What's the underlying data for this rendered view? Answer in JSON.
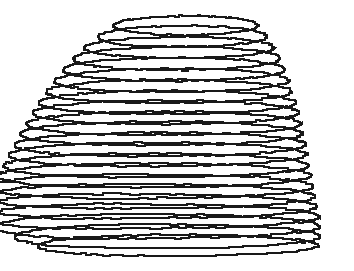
{
  "figure": {
    "title": "",
    "caption": "",
    "kind": "wireframe-contour-surface",
    "background_color": "#ffffff",
    "line_color": "#191919",
    "line_width_px": 2,
    "canvas": {
      "width": 354,
      "height": 271
    }
  },
  "chart_data": {
    "type": "line",
    "title": "",
    "subtitle": "",
    "xlabel": "",
    "ylabel": "",
    "xlim": [
      0,
      354
    ],
    "ylim": [
      0,
      271
    ],
    "grid": false,
    "legend": null,
    "annotations": [],
    "tick_labels": {
      "x": [],
      "y": []
    },
    "series_count": 22,
    "projection": {
      "type": "oblique",
      "shear_per_level_px": -6.2
    },
    "series": [
      {
        "name": "ring-01",
        "cx": 186,
        "cy": 26,
        "rx": 72,
        "ry": 9,
        "lobe": 0.0,
        "values": [
          72,
          9
        ]
      },
      {
        "name": "ring-02",
        "cx": 183,
        "cy": 37,
        "rx": 84,
        "ry": 10,
        "lobe": 0.02,
        "values": [
          84,
          10
        ]
      },
      {
        "name": "ring-03",
        "cx": 180,
        "cy": 48,
        "rx": 94,
        "ry": 10,
        "lobe": 0.04,
        "values": [
          94,
          10
        ]
      },
      {
        "name": "ring-04",
        "cx": 178,
        "cy": 59,
        "rx": 102,
        "ry": 11,
        "lobe": 0.06,
        "values": [
          102,
          11
        ]
      },
      {
        "name": "ring-05",
        "cx": 176,
        "cy": 70,
        "rx": 109,
        "ry": 11,
        "lobe": 0.08,
        "values": [
          109,
          11
        ]
      },
      {
        "name": "ring-06",
        "cx": 174,
        "cy": 81,
        "rx": 115,
        "ry": 11,
        "lobe": 0.11,
        "values": [
          115,
          11
        ]
      },
      {
        "name": "ring-07",
        "cx": 172,
        "cy": 92,
        "rx": 120,
        "ry": 11,
        "lobe": 0.14,
        "values": [
          120,
          11
        ]
      },
      {
        "name": "ring-08",
        "cx": 171,
        "cy": 103,
        "rx": 125,
        "ry": 11,
        "lobe": 0.17,
        "values": [
          125,
          11
        ]
      },
      {
        "name": "ring-09",
        "cx": 170,
        "cy": 113,
        "rx": 129,
        "ry": 11,
        "lobe": 0.21,
        "values": [
          129,
          11
        ]
      },
      {
        "name": "ring-10",
        "cx": 169,
        "cy": 124,
        "rx": 132,
        "ry": 11,
        "lobe": 0.25,
        "values": [
          132,
          11
        ]
      },
      {
        "name": "ring-11",
        "cx": 168,
        "cy": 134,
        "rx": 135,
        "ry": 11,
        "lobe": 0.3,
        "values": [
          135,
          11
        ]
      },
      {
        "name": "ring-12",
        "cx": 168,
        "cy": 145,
        "rx": 138,
        "ry": 11,
        "lobe": 0.36,
        "values": [
          138,
          11
        ]
      },
      {
        "name": "ring-13",
        "cx": 167,
        "cy": 155,
        "rx": 140,
        "ry": 11,
        "lobe": 0.43,
        "values": [
          140,
          11
        ]
      },
      {
        "name": "ring-14",
        "cx": 167,
        "cy": 166,
        "rx": 142,
        "ry": 11,
        "lobe": 0.51,
        "values": [
          142,
          11
        ]
      },
      {
        "name": "ring-15",
        "cx": 167,
        "cy": 176,
        "rx": 144,
        "ry": 11,
        "lobe": 0.6,
        "values": [
          144,
          11
        ]
      },
      {
        "name": "ring-16",
        "cx": 167,
        "cy": 187,
        "rx": 146,
        "ry": 11,
        "lobe": 0.7,
        "values": [
          146,
          11
        ]
      },
      {
        "name": "ring-17",
        "cx": 168,
        "cy": 197,
        "rx": 147,
        "ry": 11,
        "lobe": 0.8,
        "values": [
          147,
          11
        ]
      },
      {
        "name": "ring-18",
        "cx": 169,
        "cy": 207,
        "rx": 148,
        "ry": 11,
        "lobe": 0.9,
        "values": [
          148,
          11
        ]
      },
      {
        "name": "ring-19",
        "cx": 171,
        "cy": 217,
        "rx": 148,
        "ry": 11,
        "lobe": 0.96,
        "values": [
          148,
          11
        ]
      },
      {
        "name": "ring-20",
        "cx": 174,
        "cy": 227,
        "rx": 146,
        "ry": 11,
        "lobe": 0.8,
        "values": [
          146,
          11
        ]
      },
      {
        "name": "ring-21",
        "cx": 178,
        "cy": 237,
        "rx": 142,
        "ry": 11,
        "lobe": 0.5,
        "values": [
          142,
          11
        ]
      },
      {
        "name": "ring-22",
        "cx": 182,
        "cy": 246,
        "rx": 136,
        "ry": 10,
        "lobe": 0.2,
        "values": [
          136,
          10
        ]
      }
    ]
  }
}
